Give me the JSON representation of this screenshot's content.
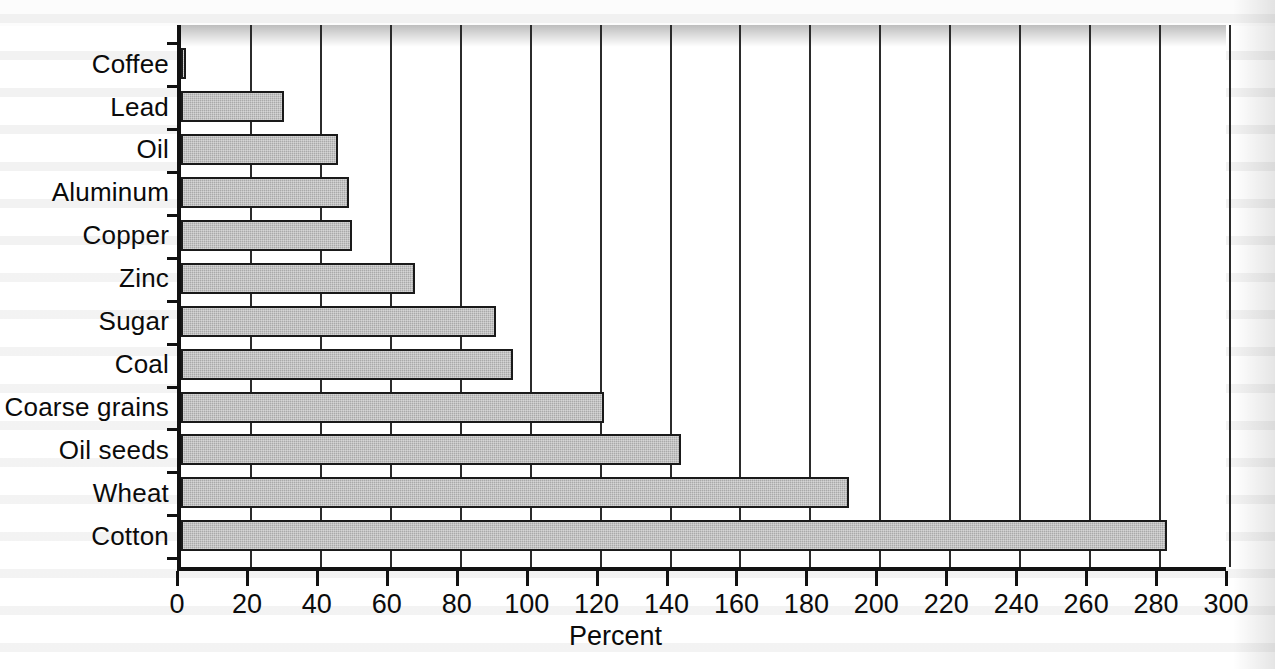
{
  "chart_data": {
    "type": "bar",
    "orientation": "horizontal",
    "title": "",
    "subtitle": "",
    "xlabel": "Percent",
    "ylabel": "",
    "xlim": [
      0,
      300
    ],
    "xticks": [
      0,
      20,
      40,
      60,
      80,
      100,
      120,
      140,
      160,
      180,
      200,
      220,
      240,
      260,
      280,
      300
    ],
    "xtick_labels": [
      "0",
      "20",
      "40",
      "60",
      "80",
      "100",
      "120",
      "140",
      "160",
      "180",
      "200",
      "220",
      "240",
      "260",
      "280",
      "300"
    ],
    "grid": "vertical",
    "legend": "none",
    "categories": [
      "Coffee",
      "Lead",
      "Oil",
      "Aluminum",
      "Copper",
      "Zinc",
      "Sugar",
      "Coal",
      "Coarse grains",
      "Oil seeds",
      "Wheat",
      "Cotton"
    ],
    "values": [
      1.5,
      29.5,
      45,
      48,
      49,
      67,
      90,
      95,
      121,
      143,
      191,
      282
    ],
    "series": [
      {
        "name": "Percent",
        "values": [
          1.5,
          29.5,
          45,
          48,
          49,
          67,
          90,
          95,
          121,
          143,
          191,
          282
        ]
      }
    ],
    "bar_fill_color": "#a9a9a9",
    "bar_edge_color": "#1a1a1a",
    "axis_color": "#111111",
    "gridline_color": "#2b2b2b",
    "background_color": "#ffffff"
  },
  "axis": {
    "x_title": "Percent"
  }
}
